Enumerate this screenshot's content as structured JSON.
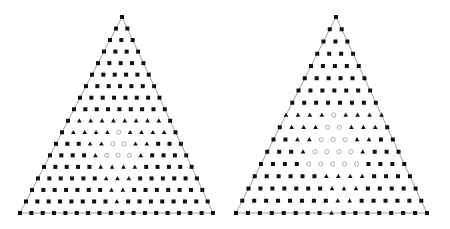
{
  "colors": {
    "edge": "#888888",
    "filled": "#111111",
    "hollow": "#999999",
    "background": "#ffffff"
  },
  "legend": {
    "square": "filled-square",
    "triangle": "filled-triangle",
    "circle": "hollow-circle"
  },
  "diagrams": [
    {
      "name": "left-simplex",
      "apex": [
        122,
        17
      ],
      "base_left": [
        20,
        213
      ],
      "base_right": [
        213,
        213
      ],
      "rows": [
        "S",
        "SS",
        "SSS",
        "SSSS",
        "SSSSS",
        "SSSSSS",
        "SSSSSSS",
        "SSSSSSSS",
        "SSSSSSSSS",
        "STTTTTTTTS",
        "STTTTOTTTTS",
        "SSSTTOOTTSSS",
        "SSSSTOOOTSSSS",
        "SSSSSTTTTSSSSS",
        "SSSSSSTTTSSSSSS",
        "SSSSSSSTTSSSSSSS",
        "SSSSSSSSTSSSSSSSS",
        "SSSSSSSSSSSSSSSSSS"
      ]
    },
    {
      "name": "right-simplex",
      "apex": [
        336,
        17
      ],
      "base_left": [
        236,
        213
      ],
      "base_right": [
        427,
        213
      ],
      "rows": [
        "S",
        "SS",
        "SSS",
        "SSSS",
        "SSSSS",
        "SSSSSS",
        "SSSSSSS",
        "SSSSSSSS",
        "TTTTOTTTT",
        "STTTOOTTTS",
        "SSTTOOOTTSS",
        "SSSTOOOOTSSS",
        "SSSSOOOOOSSSS",
        "SSSSSSTTTTSSSS",
        "SSSSSSSTTTSSSSS",
        "SSSSSSSSTTSSSSSS",
        "SSSSSSSSTSSSSSSSS"
      ]
    }
  ]
}
